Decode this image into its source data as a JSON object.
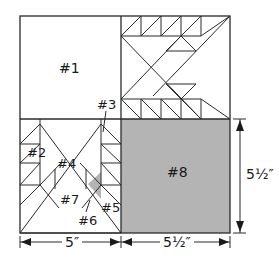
{
  "diagram": {
    "type": "quilt-block-layout",
    "colors": {
      "line": "#2a2a2a",
      "fill_gray": "#b4b4b4",
      "background": "#ffffff"
    },
    "pieces": [
      {
        "id": "#1",
        "label": "#1"
      },
      {
        "id": "#2",
        "label": "#2"
      },
      {
        "id": "#3",
        "label": "#3"
      },
      {
        "id": "#4",
        "label": "#4"
      },
      {
        "id": "#5",
        "label": "#5"
      },
      {
        "id": "#6",
        "label": "#6"
      },
      {
        "id": "#7",
        "label": "#7"
      },
      {
        "id": "#8",
        "label": "#8"
      }
    ],
    "dimensions": {
      "bottom_left_width": "5″",
      "bottom_right_width": "5½″",
      "right_height": "5½″"
    }
  }
}
